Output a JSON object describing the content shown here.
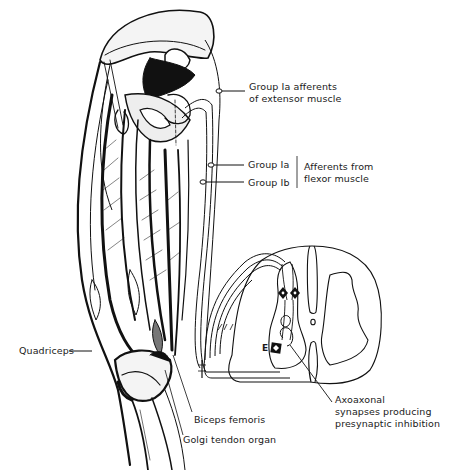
{
  "figure": {
    "type": "anatomical-diagram"
  },
  "labels": {
    "group_ia_extensor_line1": "Group Ia afferents",
    "group_ia_extensor_line2": "of extensor muscle",
    "group_ia_flexor": "Group Ia",
    "group_ib_flexor": "Group Ib",
    "flexor_afferents_line1": "Afferents from",
    "flexor_afferents_line2": "flexor muscle",
    "quadriceps": "Quadriceps",
    "biceps_femoris": "Biceps femoris",
    "golgi_tendon_organ": "Golgi tendon organ",
    "axoaxonal_line1": "Axoaxonal",
    "axoaxonal_line2": "synapses producing",
    "axoaxonal_line3": "presynaptic inhibition",
    "motor_neuron_marker": "E"
  },
  "colors": {
    "ink": "#111111",
    "background": "#ffffff"
  }
}
